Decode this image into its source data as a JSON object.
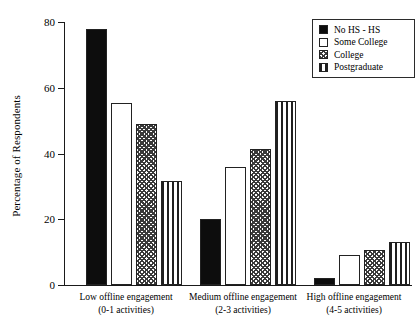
{
  "chart_data": {
    "type": "bar",
    "title": "",
    "xlabel": "",
    "ylabel": "Percentage of Respondents",
    "ylim": [
      0,
      80
    ],
    "yticks": [
      0,
      20,
      40,
      60,
      80
    ],
    "ytick_labels": [
      "0",
      "20",
      "40",
      "60",
      "80"
    ],
    "grid": false,
    "legend_position": "top-right",
    "categories": [
      "Low offline engagement\n(0-1 activities)",
      "Medium offline engagement\n(2-3 activities)",
      "High offline engagement\n(4-5 activities)"
    ],
    "category_lines": [
      {
        "line1": "Low offline engagement",
        "line2": "(0-1 activities)"
      },
      {
        "line1": "Medium offline engagement",
        "line2": "(2-3 activities)"
      },
      {
        "line1": "High offline engagement",
        "line2": "(4-5 activities)"
      }
    ],
    "series": [
      {
        "name": "No HS - HS",
        "pattern": "solid-black",
        "values": [
          78,
          20,
          2
        ]
      },
      {
        "name": "Some College",
        "pattern": "white-open",
        "values": [
          55.5,
          36,
          9
        ]
      },
      {
        "name": "College",
        "pattern": "checkered",
        "values": [
          49,
          41.5,
          10.5
        ]
      },
      {
        "name": "Postgraduate",
        "pattern": "vertical-stripe",
        "values": [
          31.5,
          56,
          13
        ]
      }
    ]
  },
  "legend": {
    "items": [
      {
        "label": "No HS - HS"
      },
      {
        "label": "Some College"
      },
      {
        "label": "College"
      },
      {
        "label": "Postgraduate"
      }
    ]
  },
  "colors": {
    "axis": "#1a1a1a",
    "bar_outline": "#222222",
    "solid_fill": "#0d0d0d",
    "background": "#ffffff"
  }
}
